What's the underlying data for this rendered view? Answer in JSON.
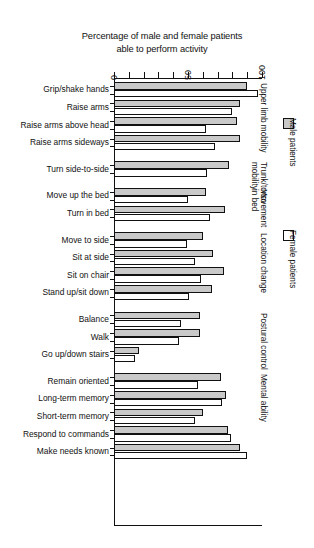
{
  "chart_data": {
    "type": "bar",
    "orientation": "horizontal",
    "title": "Percentage of male and female patients able to perform activity",
    "title_line1": "Percentage of male and female patients",
    "title_line2": "able to perform activity",
    "xlabel": "",
    "ylabel": "",
    "xlim": [
      0,
      100
    ],
    "xticks": [
      0,
      10,
      20,
      30,
      40,
      50,
      60,
      70,
      80,
      90,
      100
    ],
    "xtick_labels": [
      "0",
      "",
      "",
      "",
      "",
      "50",
      "",
      "",
      "",
      "",
      "100"
    ],
    "grid": false,
    "legend_position": "right",
    "categories": [
      "Grip/shake hands",
      "Raise arms",
      "Raise arms above head",
      "Raise arms sideways",
      "Turn side-to-side",
      "Move up the bed",
      "Turn in bed",
      "Move to side",
      "Sit at side",
      "Sit on chair",
      "Stand up/sit down",
      "Balance",
      "Walk",
      "Go up/down stairs",
      "Remain oriented",
      "Long-term memory",
      "Short-term memory",
      "Respond to commands",
      "Make needs known"
    ],
    "series": [
      {
        "name": "Male patients",
        "color": "#c9c9c9",
        "values": [
          90,
          85,
          83,
          85,
          78,
          62,
          75,
          60,
          67,
          74,
          66,
          58,
          58,
          17,
          72,
          76,
          60,
          77,
          85
        ]
      },
      {
        "name": "Female patients",
        "color": "#ffffff",
        "values": [
          97,
          80,
          62,
          68,
          63,
          50,
          65,
          49,
          55,
          59,
          51,
          45,
          44,
          14,
          57,
          73,
          55,
          79,
          90
        ]
      }
    ],
    "groups": [
      {
        "label": "Upper limb mobility",
        "categories": [
          "Grip/shake hands",
          "Raise arms",
          "Raise arms above head",
          "Raise arms sideways"
        ]
      },
      {
        "label": "Trunk/torso mobility",
        "categories": [
          "Turn side-to-side"
        ]
      },
      {
        "label": "Movement in bed",
        "categories": [
          "Move up the bed",
          "Turn in bed"
        ]
      },
      {
        "label": "Location change",
        "categories": [
          "Move to side",
          "Sit at side",
          "Sit on chair",
          "Stand up/sit down"
        ]
      },
      {
        "label": "Postural control",
        "categories": [
          "Balance",
          "Walk",
          "Go up/down stairs"
        ]
      },
      {
        "label": "Mental ability",
        "categories": [
          "Remain oriented",
          "Long-term memory",
          "Short-term memory",
          "Respond to commands",
          "Make needs known"
        ]
      }
    ]
  },
  "legend": {
    "items": [
      {
        "label": "Male patients",
        "swatch": "male"
      },
      {
        "label": "Female patients",
        "swatch": "female"
      }
    ]
  }
}
